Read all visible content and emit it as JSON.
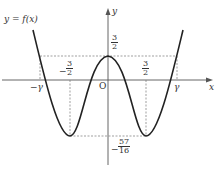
{
  "graph": {
    "function_label": "y = f(x)",
    "x_axis_label": "x",
    "y_axis_label": "y",
    "origin_label": "O",
    "x_ticks": [
      {
        "label": "−γ"
      },
      {
        "label": "γ"
      }
    ],
    "fractions": {
      "neg_three_halves": {
        "sign": "−",
        "num": "3",
        "den": "2"
      },
      "pos_three_halves_x": {
        "num": "3",
        "den": "2"
      },
      "pos_three_halves_y": {
        "num": "3",
        "den": "2"
      },
      "neg_57_16": {
        "sign": "−",
        "num": "57",
        "den": "16"
      }
    },
    "colors": {
      "curve": "#222222",
      "axis": "#555555",
      "dashed": "#777777"
    }
  }
}
